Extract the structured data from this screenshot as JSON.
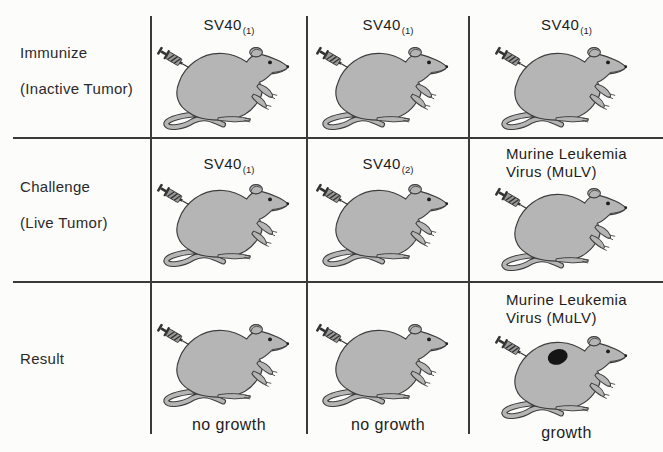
{
  "diagram": {
    "rows": [
      {
        "label_line1": "Immunize",
        "label_line2": "(Inactive Tumor)",
        "cells": [
          {
            "agent_base": "SV40",
            "agent_sub": "(1)"
          },
          {
            "agent_base": "SV40",
            "agent_sub": "(1)"
          },
          {
            "agent_base": "SV40",
            "agent_sub": "(1)"
          }
        ]
      },
      {
        "label_line1": "Challenge",
        "label_line2": "(Live Tumor)",
        "cells": [
          {
            "agent_base": "SV40",
            "agent_sub": "(1)"
          },
          {
            "agent_base": "SV40",
            "agent_sub": "(2)"
          },
          {
            "agent_line1": "Murine Leukemia",
            "agent_line2": "Virus (MuLV)"
          }
        ]
      },
      {
        "label_line1": "Result",
        "cells": [
          {
            "result": "no growth"
          },
          {
            "result": "no growth"
          },
          {
            "agent_line1": "Murine Leukemia",
            "agent_line2": "Virus (MuLV)",
            "result": "growth",
            "tumor": true
          }
        ]
      }
    ]
  },
  "icons": {
    "mouse": "mouse-with-syringe-icon",
    "tumor": "tumor-spot"
  },
  "colors": {
    "background": "#fcfcfb",
    "grid_line": "#3a3a3a",
    "mouse_body": "#b5b5b5",
    "mouse_outline": "#3d3d3d",
    "syringe": "#333333",
    "tumor": "#151515",
    "text": "#1d1d1d"
  }
}
